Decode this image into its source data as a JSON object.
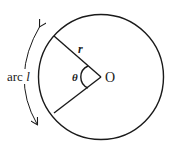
{
  "diagram": {
    "labels": {
      "arc": "arc ",
      "arc_var": "l",
      "radius": "r",
      "angle": "θ",
      "center": "O"
    },
    "colors": {
      "stroke": "#1a1a1a",
      "background": "#ffffff"
    },
    "geometry": {
      "center": [
        101,
        77
      ],
      "radius": 63,
      "radius_endpoints": [
        [
          53,
          36
        ],
        [
          53,
          113
        ]
      ]
    }
  }
}
